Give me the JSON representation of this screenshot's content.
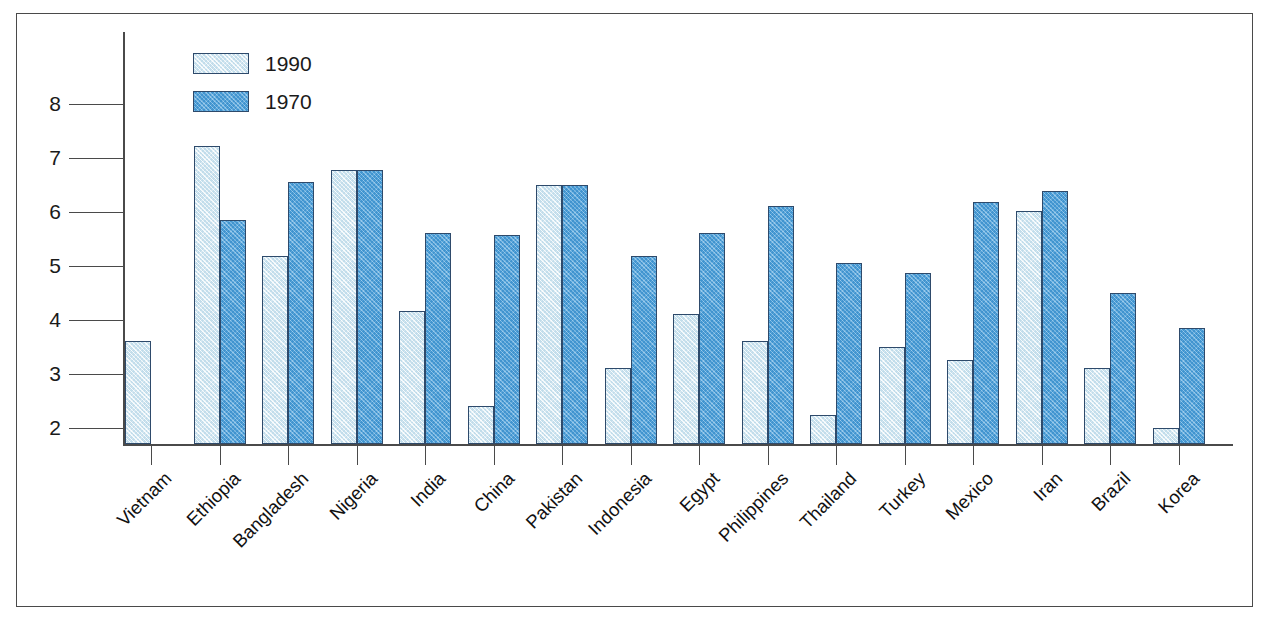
{
  "chart_data": {
    "type": "bar",
    "title": "",
    "subtitle": "",
    "xlabel": "",
    "ylabel": "",
    "ylim": [
      1.7,
      8.6
    ],
    "yticks": [
      2,
      3,
      4,
      5,
      6,
      7,
      8
    ],
    "ytick_labels": [
      "2",
      "3",
      "4",
      "5",
      "6",
      "7",
      "8"
    ],
    "grid": false,
    "legend_position": "top-left",
    "categories": [
      "Vietnam",
      "Ethiopia",
      "Bangladesh",
      "Nigeria",
      "India",
      "China",
      "Pakistan",
      "Indonesia",
      "Egypt",
      "Philippines",
      "Thailand",
      "Turkey",
      "Mexico",
      "Iran",
      "Brazil",
      "Korea"
    ],
    "series": [
      {
        "name": "1990",
        "color": "#d9ecf5",
        "values": [
          3.61,
          7.22,
          5.19,
          6.77,
          4.16,
          2.41,
          6.5,
          3.12,
          4.11,
          3.62,
          2.25,
          3.5,
          3.26,
          6.01,
          3.11,
          2.0
        ]
      },
      {
        "name": "1970",
        "color": "#4da2dd",
        "values": [
          null,
          5.85,
          6.56,
          6.78,
          5.62,
          5.57,
          6.5,
          5.19,
          5.62,
          6.12,
          5.05,
          4.87,
          6.18,
          6.39,
          4.5,
          3.86
        ]
      }
    ]
  },
  "legend": {
    "items": [
      {
        "label": "1990"
      },
      {
        "label": "1970"
      }
    ]
  },
  "colors": {
    "series_1990": "#d9ecf5",
    "series_1970": "#4da2dd",
    "bar_outline": "#2e4a6b",
    "axis": "#4a4a4a",
    "frame": "#4a4a4a",
    "text": "#111111",
    "background": "#ffffff"
  }
}
